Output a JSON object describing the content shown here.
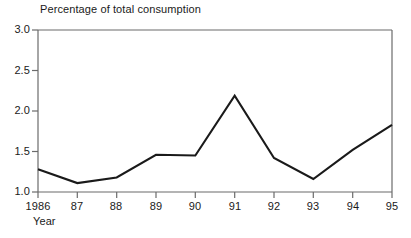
{
  "chart_data": {
    "type": "line",
    "title": "Percentage of total consumption",
    "xlabel": "Year",
    "ylabel": "",
    "categories": [
      "1986",
      "87",
      "88",
      "89",
      "90",
      "91",
      "92",
      "93",
      "94",
      "95"
    ],
    "x": [
      1986,
      1987,
      1988,
      1989,
      1990,
      1991,
      1992,
      1993,
      1994,
      1995
    ],
    "values": [
      1.28,
      1.11,
      1.18,
      1.46,
      1.45,
      2.19,
      1.42,
      1.16,
      1.52,
      1.83
    ],
    "series": [
      {
        "name": "Percentage of total consumption",
        "values": [
          1.28,
          1.11,
          1.18,
          1.46,
          1.45,
          2.19,
          1.42,
          1.16,
          1.52,
          1.83
        ]
      }
    ],
    "ylim": [
      1.0,
      3.0
    ],
    "yticks": [
      "1.0",
      "1.5",
      "2.0",
      "2.5",
      "3.0"
    ],
    "ytick_values": [
      1.0,
      1.5,
      2.0,
      2.5,
      3.0
    ],
    "grid": false,
    "legend": "none",
    "line_color": "#1a1a1a",
    "axis_color": "#555555",
    "background_color": "#ffffff"
  },
  "axis": {
    "y_labels": [
      "3.0",
      "2.5",
      "2.0",
      "1.5",
      "1.0"
    ],
    "x_labels": [
      "1986",
      "87",
      "88",
      "89",
      "90",
      "91",
      "92",
      "93",
      "94",
      "95"
    ],
    "x_title": "Year"
  },
  "header": {
    "title": "Percentage of total consumption"
  }
}
